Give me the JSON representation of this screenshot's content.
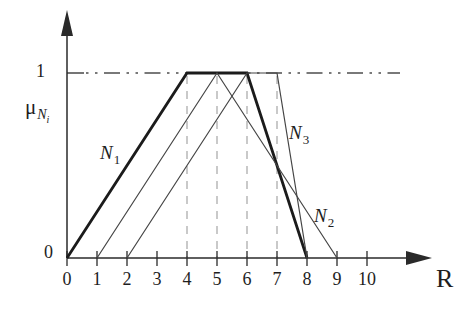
{
  "figure": {
    "background": "#ffffff",
    "ink_color": "#1e1e1e"
  },
  "axes": {
    "x_label": "R",
    "y_label": {
      "main": "μ",
      "sub": "N",
      "subsub": "i"
    },
    "y_tick_one": "1",
    "y_tick_zero": "0",
    "x_ticks": [
      "0",
      "1",
      "2",
      "3",
      "4",
      "5",
      "6",
      "7",
      "8",
      "9",
      "10"
    ],
    "origin_px": {
      "x": 67,
      "y": 258
    },
    "x_step_px": 30,
    "y_one_px": 73,
    "x_axis_end_px": 424,
    "x_arrow_tip_px": 432,
    "y_axis_end_px": 34,
    "y_arrow_tip_px": 10
  },
  "chart_data": {
    "type": "line",
    "xlabel": "R",
    "ylabel": "μ_Ni",
    "xlim": [
      0,
      11.8
    ],
    "ylim": [
      0,
      1.3
    ],
    "grid": "vertical dashed lines at x = 4,5,6,7; horizontal dash-dot line at μ = 1",
    "legend_position": "inline curve labels",
    "series": [
      {
        "name": "N1",
        "label_main": "N",
        "label_sub": "1",
        "points": [
          [
            0,
            0
          ],
          [
            4,
            1
          ],
          [
            6,
            1
          ],
          [
            8,
            0
          ]
        ],
        "stroke_width": 2.8,
        "color": "#1b1b1b",
        "label_pos_x": 1.1,
        "label_pos_y": 0.62
      },
      {
        "name": "N2",
        "label_main": "N",
        "label_sub": "2",
        "points": [
          [
            1,
            0
          ],
          [
            5,
            1
          ],
          [
            9,
            0
          ]
        ],
        "stroke_width": 1.2,
        "color": "#454545",
        "label_pos_x": 8.23,
        "label_pos_y": 0.28
      },
      {
        "name": "N3",
        "label_main": "N",
        "label_sub": "3",
        "points": [
          [
            2,
            0
          ],
          [
            6,
            1
          ],
          [
            7,
            1
          ],
          [
            8,
            0
          ]
        ],
        "stroke_width": 1.2,
        "color": "#454545",
        "label_pos_x": 7.4,
        "label_pos_y": 0.73
      }
    ],
    "reference_lines": {
      "horizontal_dashdot_mu": 1,
      "horizontal_dashdot_end_px": 400,
      "vertical_dashed_x": [
        4,
        5,
        6,
        7
      ]
    },
    "style": {
      "axis_color": "#2a2a2a",
      "grid_color": "#adadad",
      "dashdot_color": "#4e4e4e"
    }
  }
}
